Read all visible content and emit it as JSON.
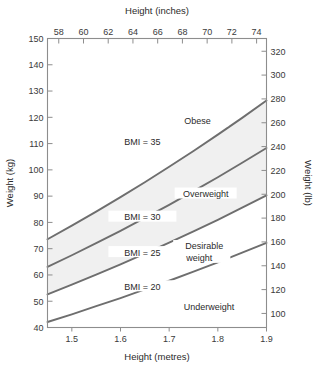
{
  "chart_data": {
    "type": "line",
    "title": "",
    "subtitle": "",
    "xlabel": "Height (metres)",
    "ylabel": "Weight (kg)",
    "x2label": "Height (inches)",
    "y2label": "Weight (lb)",
    "xlim": [
      1.45,
      1.9
    ],
    "ylim": [
      40,
      150
    ],
    "x2lim": [
      57.09,
      74.8
    ],
    "y2lim": [
      88.2,
      330.7
    ],
    "grid": false,
    "legend": "none",
    "xticks": [
      1.5,
      1.6,
      1.7,
      1.8,
      1.9
    ],
    "xtick_labels": [
      "1.5",
      "1.6",
      "1.7",
      "1.8",
      "1.9"
    ],
    "yticks": [
      40,
      50,
      60,
      70,
      80,
      90,
      100,
      110,
      120,
      130,
      140,
      150
    ],
    "ytick_labels": [
      "40",
      "50",
      "60",
      "70",
      "80",
      "90",
      "100",
      "110",
      "120",
      "130",
      "140",
      "150"
    ],
    "x2ticks": [
      58,
      60,
      62,
      64,
      66,
      68,
      70,
      72,
      74
    ],
    "x2tick_labels": [
      "58",
      "60",
      "62",
      "64",
      "66",
      "68",
      "70",
      "72",
      "74"
    ],
    "y2ticks": [
      100,
      120,
      140,
      160,
      180,
      200,
      220,
      240,
      260,
      280,
      300,
      320
    ],
    "y2tick_labels": [
      "100",
      "120",
      "140",
      "160",
      "180",
      "200",
      "220",
      "240",
      "260",
      "280",
      "300",
      "320"
    ],
    "series": [
      {
        "name": "BMI = 20",
        "bmi": 20,
        "label": "BMI = 20",
        "label_x": 1.645,
        "label_y": 55.5,
        "x": [
          1.45,
          1.5,
          1.55,
          1.6,
          1.65,
          1.7,
          1.75,
          1.8,
          1.85,
          1.9
        ],
        "values": [
          42.1,
          45.0,
          48.1,
          51.2,
          54.5,
          57.8,
          61.3,
          64.8,
          68.5,
          72.2
        ]
      },
      {
        "name": "BMI = 25",
        "bmi": 25,
        "label": "BMI = 25",
        "label_x": 1.645,
        "label_y": 68.5,
        "x": [
          1.45,
          1.5,
          1.55,
          1.6,
          1.65,
          1.7,
          1.75,
          1.8,
          1.85,
          1.9
        ],
        "values": [
          52.6,
          56.3,
          60.1,
          64.0,
          68.1,
          72.3,
          76.6,
          81.0,
          85.6,
          90.3
        ]
      },
      {
        "name": "BMI = 30",
        "bmi": 30,
        "label": "BMI = 30",
        "label_x": 1.645,
        "label_y": 82.0,
        "x": [
          1.45,
          1.5,
          1.55,
          1.6,
          1.65,
          1.7,
          1.75,
          1.8,
          1.85,
          1.9
        ],
        "values": [
          63.1,
          67.5,
          72.1,
          76.8,
          81.7,
          86.7,
          91.9,
          97.2,
          102.7,
          108.3
        ]
      },
      {
        "name": "BMI = 35",
        "bmi": 35,
        "label": "BMI = 35",
        "label_x": 1.645,
        "label_y": 110.5,
        "x": [
          1.45,
          1.5,
          1.55,
          1.6,
          1.65,
          1.7,
          1.75,
          1.8,
          1.85,
          1.9
        ],
        "values": [
          73.6,
          78.8,
          84.1,
          89.6,
          95.3,
          101.2,
          107.2,
          113.4,
          119.8,
          126.4
        ]
      }
    ],
    "shaded_band": {
      "label": "overweight-to-obese band",
      "lower_series": "BMI = 25",
      "upper_series": "BMI = 35",
      "color": "#f0f0f0"
    },
    "annotations": [
      {
        "name": "obese",
        "text": "Obese",
        "x": 1.758,
        "y": 118.5
      },
      {
        "name": "overweight",
        "text": "Overweight",
        "x": 1.775,
        "y": 91.0
      },
      {
        "name": "desirable-weight-line1",
        "text": "Desirable",
        "x": 1.772,
        "y": 71.0
      },
      {
        "name": "desirable-weight-line2",
        "text": "weight",
        "x": 1.762,
        "y": 66.5
      },
      {
        "name": "underweight",
        "text": "Underweight",
        "x": 1.782,
        "y": 48.0
      }
    ],
    "colors": {
      "line": "#6e6e6e",
      "frame": "#8d8d8d",
      "band": "#f0f0f0",
      "text": "#2b2b2b",
      "background": "#ffffff"
    }
  }
}
